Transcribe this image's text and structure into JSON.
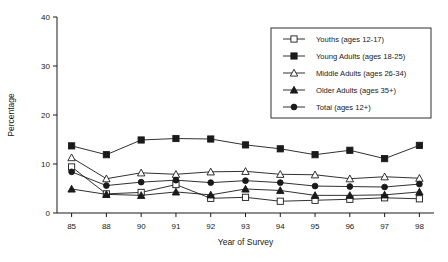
{
  "chart_data": {
    "type": "line",
    "title": "",
    "xlabel": "Year of Survey",
    "ylabel": "Percentage",
    "categories": [
      "85",
      "88",
      "90",
      "91",
      "92",
      "93",
      "94",
      "95",
      "96",
      "97",
      "98"
    ],
    "ylim": [
      0,
      40
    ],
    "yticks": [
      "0",
      "10",
      "20",
      "30",
      "40"
    ],
    "grid": false,
    "legend_position": "upper-right",
    "series": [
      {
        "name": "Youths (ages 12-17)",
        "marker": "open-square",
        "values": [
          9.4,
          3.9,
          4.2,
          5.8,
          3.0,
          3.2,
          2.4,
          2.6,
          2.8,
          3.1,
          2.9
        ]
      },
      {
        "name": "Young Adults (ages 18-25)",
        "marker": "filled-square",
        "values": [
          13.7,
          11.9,
          14.9,
          15.2,
          15.1,
          13.9,
          13.1,
          11.9,
          12.8,
          11.1,
          13.8
        ]
      },
      {
        "name": "Middle Adults (ages 26-34)",
        "marker": "open-triangle",
        "values": [
          11.3,
          7.0,
          8.2,
          7.9,
          8.4,
          8.5,
          7.9,
          7.8,
          7.0,
          7.4,
          7.1
        ]
      },
      {
        "name": "Older Adults (ages 35+)",
        "marker": "filled-triangle",
        "values": [
          4.9,
          3.8,
          3.6,
          4.3,
          3.7,
          4.9,
          4.6,
          3.6,
          3.6,
          3.7,
          4.3
        ]
      },
      {
        "name": "Total (ages 12+)",
        "marker": "filled-circle",
        "values": [
          8.4,
          5.6,
          6.3,
          6.7,
          6.2,
          6.6,
          6.2,
          5.5,
          5.4,
          5.3,
          5.9
        ]
      }
    ]
  },
  "legend": {
    "entries": [
      {
        "label": "Youths (ages 12-17)"
      },
      {
        "label": "Young Adults (ages 18-25)"
      },
      {
        "label": "Middle Adults (ages 26-34)"
      },
      {
        "label": "Older Adults (ages 35+)"
      },
      {
        "label": "Total (ages 12+)"
      }
    ]
  }
}
